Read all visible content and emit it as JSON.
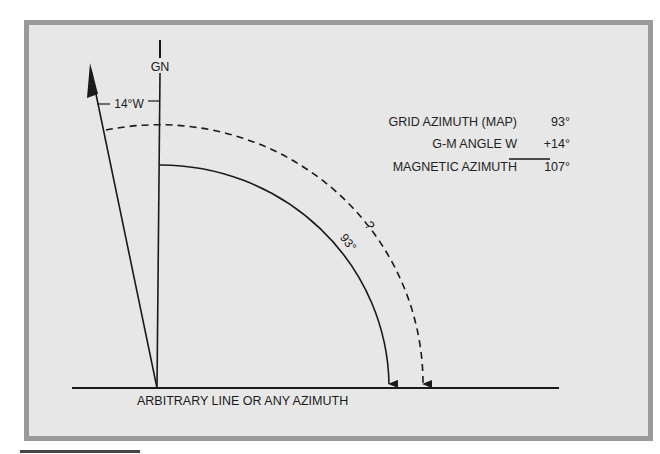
{
  "diagram": {
    "type": "azimuth_conversion_diagram",
    "labels": {
      "grid_north": "GN",
      "declination": "14°W",
      "grid_arc": "93°",
      "magnetic_arc": "?",
      "baseline": "ARBITRARY LINE OR ANY AZIMUTH"
    },
    "angles": {
      "grid_azimuth_deg": 93,
      "gm_angle_deg": 14,
      "gm_direction": "W",
      "magnetic_azimuth_deg": 107
    }
  },
  "calculation": {
    "rows": [
      {
        "label": "GRID AZIMUTH (MAP)",
        "value": "93°"
      },
      {
        "label": "G-M ANGLE W",
        "value": "+14°"
      },
      {
        "label": "MAGNETIC AZIMUTH",
        "value": "107°"
      }
    ]
  },
  "colors": {
    "frame_fill": "#e7e7e7",
    "frame_border": "#9a9a9a",
    "ink": "#1a1a1a"
  }
}
